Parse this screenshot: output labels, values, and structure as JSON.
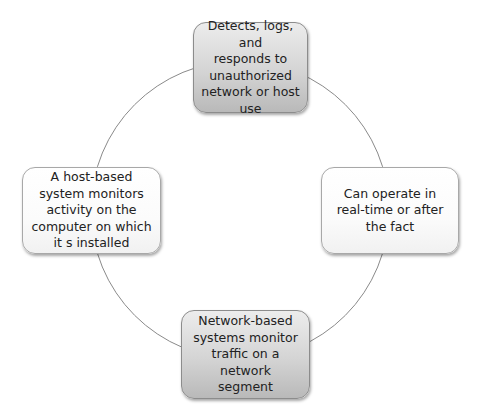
{
  "diagram": {
    "type": "cycle",
    "ring_color": "#8a8a8a",
    "nodes": [
      {
        "id": "top",
        "style": "shaded",
        "text": "Detects, logs, and\nresponds to\nunauthorized\nnetwork or host use"
      },
      {
        "id": "right",
        "style": "plain",
        "text": "Can operate in\nreal-time or after\nthe fact"
      },
      {
        "id": "bottom",
        "style": "shaded",
        "text": "Network-based\nsystems monitor\ntraffic on a network\nsegment"
      },
      {
        "id": "left",
        "style": "plain",
        "text": "A host-based\nsystem monitors\nactivity on the\ncomputer on which\nit s installed"
      }
    ]
  }
}
